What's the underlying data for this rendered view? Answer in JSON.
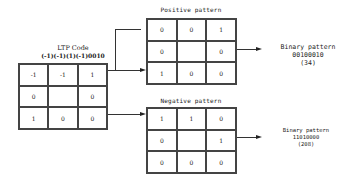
{
  "ltp": {
    "title": "LTP Code",
    "code": "(-1)(-1)(1)(-1)0010",
    "cells": [
      "-1",
      "-1",
      "1",
      "0",
      "",
      "0",
      "1",
      "0",
      "0"
    ]
  },
  "positive": {
    "title": "Positive pattern",
    "cells": [
      "0",
      "0",
      "1",
      "0",
      "",
      "0",
      "1",
      "0",
      "0"
    ],
    "output_label": "Binary pattern",
    "binary": "00100010",
    "decimal": "(34)"
  },
  "negative": {
    "title": "Negative pattern",
    "cells": [
      "1",
      "1",
      "0",
      "0",
      "",
      "1",
      "0",
      "0",
      "0"
    ],
    "output_label": "Binary pattern",
    "binary": "11010000",
    "decimal": "(208)"
  }
}
